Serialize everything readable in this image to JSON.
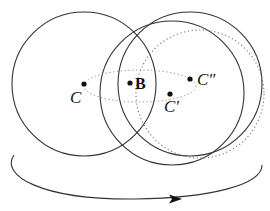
{
  "diagram": {
    "labels": {
      "c": "C",
      "b": "B",
      "c_prime": "C′",
      "c_double_prime": "C″"
    },
    "stroke_color": "#333333",
    "dotted_color": "#666666"
  }
}
